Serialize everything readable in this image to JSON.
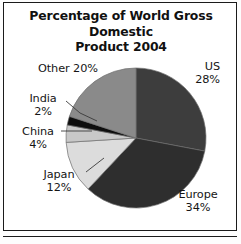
{
  "chart_data": {
    "type": "pie",
    "title": "Percentage of World Gross Domestic\nProduct  2004",
    "title_line1": "Percentage of World Gross Domestic",
    "title_line2": "Product  2004",
    "xlabel": "",
    "ylabel": "",
    "legend": "none",
    "grid": false,
    "units": "%",
    "total": 100,
    "start_angle_deg": 0,
    "direction": "clockwise",
    "categories": [
      "US",
      "Europe",
      "Japan",
      "China",
      "India",
      "Other"
    ],
    "values": [
      28,
      34,
      12,
      4,
      2,
      20
    ],
    "colors": [
      "#3d3d3d",
      "#2e2e2e",
      "#dcdcdc",
      "#c8c8c8",
      "#0d0d0d",
      "#8a8a8a"
    ],
    "slices": [
      {
        "name": "US",
        "value": 28,
        "label": "US\n28%",
        "color": "#3d3d3d",
        "leader": false
      },
      {
        "name": "Europe",
        "value": 34,
        "label": "Europe\n34%",
        "color": "#2e2e2e",
        "leader": false
      },
      {
        "name": "Japan",
        "value": 12,
        "label": "Japan\n12%",
        "color": "#dcdcdc",
        "leader": true
      },
      {
        "name": "China",
        "value": 4,
        "label": "China\n4%",
        "color": "#c8c8c8",
        "leader": true
      },
      {
        "name": "India",
        "value": 2,
        "label": "India\n2%",
        "color": "#0d0d0d",
        "leader": true
      },
      {
        "name": "Other",
        "value": 20,
        "label": "Other 20%",
        "color": "#8a8a8a",
        "leader": false
      }
    ]
  },
  "labels": {
    "us": "US\n28%",
    "europe": "Europe\n34%",
    "japan": "Japan\n12%",
    "china": "China\n4%",
    "india": "India\n2%",
    "other": "Other 20%"
  },
  "style": {
    "frame_color": "#1b1b1b",
    "background": "#ffffff",
    "text_color": "#151515"
  }
}
